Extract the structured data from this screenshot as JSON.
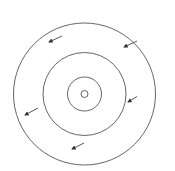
{
  "diagram": {
    "type": "concentric-circles-with-arrows",
    "stroke_color": "#555555",
    "background": "#ffffff",
    "center": [
      84.5,
      94
    ],
    "circles": [
      {
        "name": "outer-circle",
        "r": 71
      },
      {
        "name": "middle-circle",
        "r": 41.5
      },
      {
        "name": "inner-circle",
        "r": 17
      },
      {
        "name": "core-circle",
        "r": 3.5
      }
    ],
    "arrows": [
      {
        "from": [
          62,
          36
        ],
        "to": [
          49,
          42
        ]
      },
      {
        "from": [
          137,
          41
        ],
        "to": [
          124,
          47
        ]
      },
      {
        "from": [
          137,
          96.5
        ],
        "to": [
          128,
          102
        ]
      },
      {
        "from": [
          38,
          108
        ],
        "to": [
          25,
          115
        ]
      },
      {
        "from": [
          84,
          143
        ],
        "to": [
          72,
          149
        ]
      }
    ]
  }
}
